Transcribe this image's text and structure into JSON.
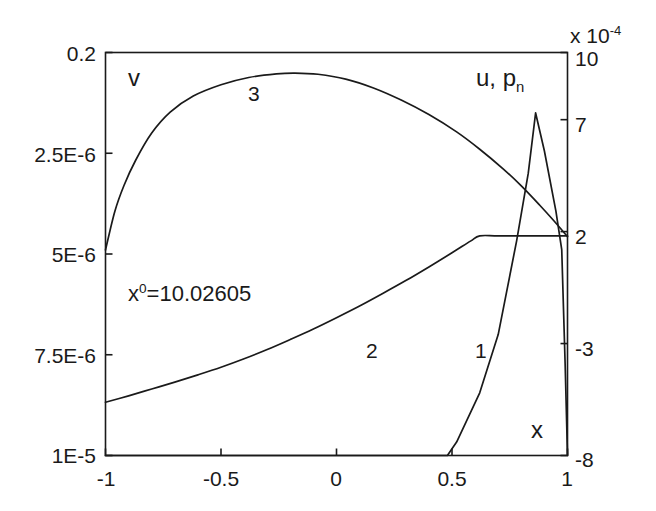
{
  "chart_data": {
    "type": "line",
    "title": "",
    "xlabel": "x",
    "left_axis_label": "v",
    "right_axis_label_main": "u, p",
    "right_axis_label_sub": "n",
    "right_axis_multiplier_prefix": "x 10",
    "right_axis_multiplier_exponent": "-4",
    "annotation_base": "x",
    "annotation_sup": "0",
    "annotation_rest": "=10.02605",
    "annotation_full": "x0=10.02605",
    "grid": false,
    "legend": "inline-curve-numbers",
    "xlim": [
      -1,
      1
    ],
    "xticks": [
      -1,
      -0.5,
      0,
      0.5,
      1
    ],
    "xticklabels": [
      "-1",
      "-0.5",
      "0",
      "0.5",
      "1"
    ],
    "left_ylim_labels": [
      "0.2",
      "2.5E-6",
      "5E-6",
      "7.5E-6",
      "1E-5"
    ],
    "left_yticks_pixelfrac": [
      0,
      0.25,
      0.5,
      0.75,
      1
    ],
    "right_yticklabels": [
      "10",
      "7",
      "2",
      "-3",
      "-8"
    ],
    "right_ylim": [
      -8,
      10
    ],
    "right_yticks": [
      10,
      7,
      2,
      -3,
      -8
    ],
    "series": [
      {
        "name": "1",
        "label": "1",
        "axis": "right",
        "description": "sharp peak near x=0.86 reaching ~7.3e-4, zero below x=0.5, drops to -8 at x=1",
        "points": [
          [
            -1,
            -8
          ],
          [
            0.48,
            -8
          ],
          [
            0.52,
            -7.4
          ],
          [
            0.62,
            -5.2
          ],
          [
            0.7,
            -2.6
          ],
          [
            0.78,
            1.6
          ],
          [
            0.83,
            4.6
          ],
          [
            0.862,
            7.3
          ],
          [
            0.9,
            5.6
          ],
          [
            0.95,
            2.9
          ],
          [
            0.975,
            1.2
          ],
          [
            0.99,
            -4.0
          ],
          [
            1.0,
            -8
          ]
        ]
      },
      {
        "name": "2",
        "label": "2",
        "axis": "left",
        "description": "rising curve from lower-left reaching a plateau after x=0.62",
        "points": [
          [
            -1,
            0.868
          ],
          [
            -0.9,
            0.852
          ],
          [
            -0.8,
            0.835
          ],
          [
            -0.7,
            0.818
          ],
          [
            -0.6,
            0.8
          ],
          [
            -0.5,
            0.781
          ],
          [
            -0.4,
            0.76
          ],
          [
            -0.3,
            0.737
          ],
          [
            -0.2,
            0.712
          ],
          [
            -0.1,
            0.686
          ],
          [
            0.0,
            0.658
          ],
          [
            0.1,
            0.629
          ],
          [
            0.2,
            0.598
          ],
          [
            0.3,
            0.566
          ],
          [
            0.4,
            0.532
          ],
          [
            0.5,
            0.497
          ],
          [
            0.58,
            0.468
          ],
          [
            0.62,
            0.455
          ],
          [
            0.7,
            0.455
          ],
          [
            0.85,
            0.455
          ],
          [
            1.0,
            0.455
          ]
        ]
      },
      {
        "name": "3",
        "label": "3",
        "axis": "left",
        "description": "arch-shaped curve peaking near x=-0.2, descending to the plateau level at x=1",
        "points": [
          [
            -1,
            0.49
          ],
          [
            -0.96,
            0.395
          ],
          [
            -0.92,
            0.33
          ],
          [
            -0.87,
            0.268
          ],
          [
            -0.8,
            0.2
          ],
          [
            -0.72,
            0.148
          ],
          [
            -0.62,
            0.108
          ],
          [
            -0.5,
            0.08
          ],
          [
            -0.38,
            0.062
          ],
          [
            -0.26,
            0.053
          ],
          [
            -0.18,
            0.051
          ],
          [
            -0.08,
            0.054
          ],
          [
            0.04,
            0.066
          ],
          [
            0.16,
            0.088
          ],
          [
            0.28,
            0.118
          ],
          [
            0.4,
            0.154
          ],
          [
            0.52,
            0.197
          ],
          [
            0.62,
            0.24
          ],
          [
            0.72,
            0.288
          ],
          [
            0.8,
            0.331
          ],
          [
            0.88,
            0.379
          ],
          [
            0.94,
            0.417
          ],
          [
            1.0,
            0.457
          ]
        ]
      }
    ],
    "curve_labels": [
      {
        "text": "1",
        "x_px": 475,
        "y_px": 352
      },
      {
        "text": "2",
        "x_px": 366,
        "y_px": 352
      },
      {
        "text": "3",
        "x_px": 248,
        "y_px": 95
      }
    ]
  },
  "axes": {
    "left_ticks": [
      "0.2",
      "2.5E-6",
      "5E-6",
      "7.5E-6",
      "1E-5"
    ],
    "right_ticks": [
      "10",
      "7",
      "2",
      "-3",
      "-8"
    ],
    "bottom_ticks": [
      "-1",
      "-0.5",
      "0",
      "0.5",
      "1"
    ]
  }
}
